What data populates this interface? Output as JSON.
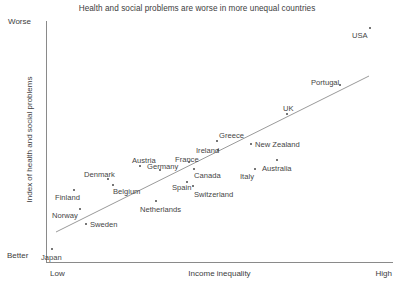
{
  "chart_data": {
    "type": "scatter",
    "title": "Health and social problems are worse in more unequal countries",
    "xlabel": "Income inequality",
    "ylabel": "Index of health and social problems",
    "x_axis_low_label": "Low",
    "x_axis_high_label": "High",
    "y_axis_low_label": "Better",
    "y_axis_high_label": "Worse",
    "grid": false,
    "legend": "none",
    "axis_ranges": {
      "x": [
        "Low",
        "High"
      ],
      "y": [
        "Better",
        "Worse"
      ]
    },
    "trend_line": {
      "visible": true,
      "x1": 56,
      "y1": 232,
      "x2": 369,
      "y2": 76
    },
    "points": [
      {
        "label": "Japan",
        "px": 52,
        "py": 249,
        "lx": 41,
        "ly": 253
      },
      {
        "label": "Norway",
        "px": 80,
        "py": 209,
        "lx": 52,
        "ly": 211
      },
      {
        "label": "Finland",
        "px": 74,
        "py": 190,
        "lx": 55,
        "ly": 193
      },
      {
        "label": "Sweden",
        "px": 86,
        "py": 224,
        "lx": 90,
        "ly": 220
      },
      {
        "label": "Denmark",
        "px": 108,
        "py": 179,
        "lx": 84,
        "ly": 170
      },
      {
        "label": "Belgium",
        "px": 113,
        "py": 185,
        "lx": 113,
        "ly": 187
      },
      {
        "label": "Netherlands",
        "px": 156,
        "py": 201,
        "lx": 140,
        "ly": 205
      },
      {
        "label": "Austria",
        "px": 140,
        "py": 166,
        "lx": 132,
        "ly": 156
      },
      {
        "label": "Germany",
        "px": 160,
        "py": 170,
        "lx": 147,
        "ly": 162
      },
      {
        "label": "France",
        "px": 189,
        "py": 162,
        "lx": 175,
        "ly": 155
      },
      {
        "label": "Spain",
        "px": 187,
        "py": 182,
        "lx": 172,
        "ly": 183
      },
      {
        "label": "Canada",
        "px": 194,
        "py": 169,
        "lx": 194,
        "ly": 171
      },
      {
        "label": "Switzerland",
        "px": 193,
        "py": 186,
        "lx": 194,
        "ly": 190
      },
      {
        "label": "Ireland",
        "px": 218,
        "py": 150,
        "lx": 196,
        "ly": 146
      },
      {
        "label": "Greece",
        "px": 217,
        "py": 141,
        "lx": 219,
        "ly": 131
      },
      {
        "label": "Italy",
        "px": 255,
        "py": 169,
        "lx": 240,
        "ly": 172
      },
      {
        "label": "New Zealand",
        "px": 251,
        "py": 144,
        "lx": 255,
        "ly": 140
      },
      {
        "label": "Australia",
        "px": 277,
        "py": 160,
        "lx": 262,
        "ly": 164
      },
      {
        "label": "UK",
        "px": 287,
        "py": 114,
        "lx": 283,
        "ly": 104
      },
      {
        "label": "Portugal",
        "px": 340,
        "py": 85,
        "lx": 311,
        "ly": 78
      },
      {
        "label": "USA",
        "px": 370,
        "py": 28,
        "lx": 352,
        "ly": 31
      }
    ]
  }
}
